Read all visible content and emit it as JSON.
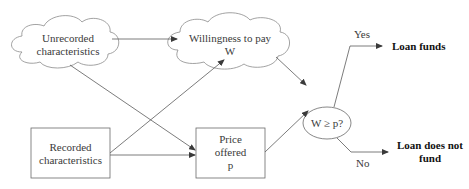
{
  "diagram": {
    "nodes": {
      "unrecorded": {
        "line1": "Unrecorded",
        "line2": "characteristics",
        "shape": "cloud"
      },
      "willingness": {
        "line1": "Willingness to pay",
        "line2": "W",
        "shape": "cloud"
      },
      "recorded": {
        "line1": "Recorded",
        "line2": "characteristics",
        "shape": "rectangle"
      },
      "price": {
        "line1": "Price",
        "line2": "offered",
        "line3": "p",
        "shape": "rectangle"
      },
      "decision": {
        "label": "W ≥ p?",
        "shape": "ellipse"
      },
      "loan_funds": {
        "label": "Loan funds"
      },
      "loan_not_fund": {
        "line1": "Loan does not",
        "line2": "fund"
      }
    },
    "edge_labels": {
      "yes": "Yes",
      "no": "No"
    },
    "edges": [
      {
        "from": "Unrecorded characteristics",
        "to": "Willingness to pay W"
      },
      {
        "from": "Unrecorded characteristics",
        "to": "Price offered p"
      },
      {
        "from": "Recorded characteristics",
        "to": "Willingness to pay W"
      },
      {
        "from": "Recorded characteristics",
        "to": "Price offered p"
      },
      {
        "from": "Willingness to pay W",
        "to": "W ≥ p?"
      },
      {
        "from": "Price offered p",
        "to": "W ≥ p?"
      },
      {
        "from": "W ≥ p?",
        "to": "Loan funds",
        "label": "Yes"
      },
      {
        "from": "W ≥ p?",
        "to": "Loan does not fund",
        "label": "No"
      }
    ],
    "colors": {
      "line": "#5a5a5a",
      "text": "#3a3a3a",
      "bold_text": "#111111",
      "background": "#ffffff"
    }
  }
}
